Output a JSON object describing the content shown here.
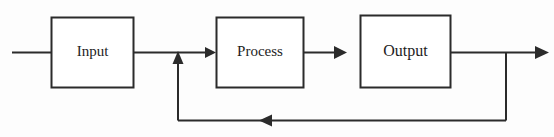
{
  "diagram": {
    "background_color": "#fdfdfd",
    "stroke_color": "#2b2b2b",
    "text_color": "#1d1d1d",
    "nodes": [
      {
        "id": "input",
        "label": "Input",
        "shape": "rectangle",
        "x": 51,
        "y": 17,
        "width": 83,
        "height": 71
      },
      {
        "id": "process",
        "label": "Process",
        "shape": "rectangle",
        "x": 216,
        "y": 17,
        "width": 88,
        "height": 71
      },
      {
        "id": "output",
        "label": "Output",
        "shape": "rectangle",
        "x": 360,
        "y": 15,
        "width": 91,
        "height": 73
      }
    ],
    "edges": [
      {
        "id": "edge-source-to-input",
        "from": "source",
        "to": "input",
        "arrowhead": "none",
        "label": ""
      },
      {
        "id": "edge-input-to-process",
        "from": "input",
        "to": "process",
        "arrowhead": "right",
        "label": ""
      },
      {
        "id": "edge-process-to-output",
        "from": "process",
        "to": "output",
        "arrowhead": "right",
        "label": ""
      },
      {
        "id": "edge-output-to-sink",
        "from": "output",
        "to": "sink",
        "arrowhead": "right",
        "label": ""
      },
      {
        "id": "edge-feedback",
        "from": "output",
        "to": "process-input-junction",
        "arrowhead": "left-and-up",
        "label": ""
      }
    ]
  }
}
